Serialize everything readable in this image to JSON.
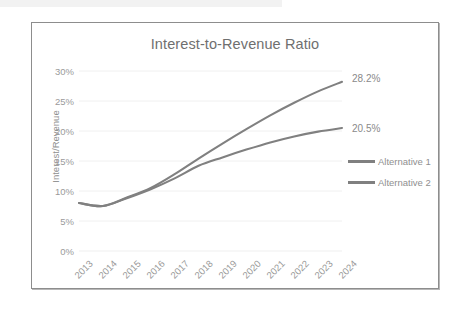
{
  "chart_data": {
    "type": "line",
    "title": "Interest-to-Revenue Ratio",
    "xlabel": "",
    "ylabel": "Interest/Revenue",
    "categories": [
      "2013",
      "2014",
      "2015",
      "2016",
      "2017",
      "2018",
      "2019",
      "2020",
      "2021",
      "2022",
      "2023",
      "2024"
    ],
    "ylim": [
      0,
      30
    ],
    "ytick_labels": [
      "0%",
      "5%",
      "10%",
      "15%",
      "20%",
      "25%",
      "30%"
    ],
    "ytick_values": [
      0,
      5,
      10,
      15,
      20,
      25,
      30
    ],
    "grid": "horizontal",
    "legend_position": "right",
    "series": [
      {
        "name": "Alternative 1",
        "color": "#808080",
        "values": [
          8.0,
          7.5,
          8.8,
          10.3,
          12.1,
          14.2,
          15.6,
          16.9,
          18.1,
          19.1,
          19.9,
          20.5
        ],
        "end_label": "20.5%"
      },
      {
        "name": "Alternative 2",
        "color": "#808080",
        "values": [
          8.0,
          7.5,
          8.9,
          10.5,
          12.8,
          15.4,
          17.9,
          20.3,
          22.6,
          24.7,
          26.6,
          28.2
        ],
        "end_label": "28.2%"
      }
    ],
    "annotations": [
      "28.2%",
      "20.5%"
    ]
  },
  "legend": {
    "items": [
      {
        "label": "Alternative 1"
      },
      {
        "label": "Alternative 2"
      }
    ]
  },
  "colors": {
    "line": "#808080",
    "gridline": "#f0f0f0",
    "axis_text": "#9a9a9a",
    "title_text": "#6f6f6f",
    "frame_border": "#8d8d8d"
  }
}
